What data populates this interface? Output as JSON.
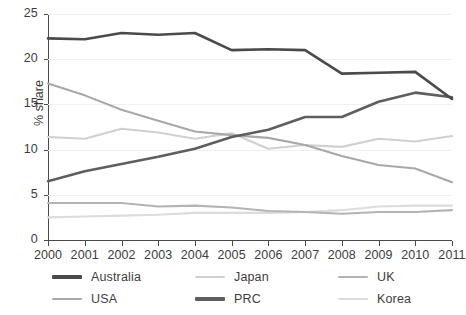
{
  "chart_data": {
    "type": "line",
    "title": "",
    "subtitle": "",
    "xlabel": "",
    "ylabel": "% share",
    "x": [
      2000,
      2001,
      2002,
      2003,
      2004,
      2005,
      2006,
      2007,
      2008,
      2009,
      2010,
      2011
    ],
    "xticklabels": [
      "2000",
      "2001",
      "2002",
      "2003",
      "2004",
      "2005",
      "2006",
      "2007",
      "2008",
      "2009",
      "2010",
      "2011"
    ],
    "yticklabels": [
      "0",
      "5",
      "10",
      "15",
      "20",
      "25"
    ],
    "yticks": [
      0,
      5,
      10,
      15,
      20,
      25
    ],
    "ylim": [
      0,
      25
    ],
    "xlim": [
      2000,
      2011
    ],
    "grid": true,
    "grid_axis": "y",
    "legend_position": "bottom",
    "legend_columns": 3,
    "series": [
      {
        "name": "Australia",
        "color": "#4a4a4a",
        "width": 2.6,
        "values": [
          22.3,
          22.2,
          22.9,
          22.7,
          22.9,
          21.0,
          21.1,
          21.0,
          18.4,
          18.5,
          18.6,
          15.6
        ]
      },
      {
        "name": "USA",
        "color": "#a8a8a8",
        "width": 2.1,
        "values": [
          17.3,
          16.0,
          14.4,
          13.2,
          12.0,
          11.6,
          11.3,
          10.5,
          9.3,
          8.3,
          7.9,
          6.4
        ]
      },
      {
        "name": "Japan",
        "color": "#d0d0d0",
        "width": 2.1,
        "values": [
          11.4,
          11.2,
          12.3,
          11.9,
          11.2,
          11.8,
          10.1,
          10.5,
          10.3,
          11.2,
          10.9,
          11.5
        ]
      },
      {
        "name": "PRC",
        "color": "#5e5e5e",
        "width": 2.6,
        "values": [
          6.5,
          7.6,
          8.4,
          9.2,
          10.1,
          11.4,
          12.2,
          13.6,
          13.6,
          15.3,
          16.3,
          15.8
        ]
      },
      {
        "name": "UK",
        "color": "#b4b4b4",
        "width": 2.1,
        "values": [
          4.1,
          4.1,
          4.1,
          3.7,
          3.8,
          3.6,
          3.2,
          3.1,
          2.9,
          3.1,
          3.1,
          3.3
        ]
      },
      {
        "name": "Korea",
        "color": "#dcdcdc",
        "width": 2.1,
        "values": [
          2.5,
          2.6,
          2.7,
          2.8,
          3.0,
          3.0,
          3.0,
          3.1,
          3.3,
          3.7,
          3.8,
          3.8
        ]
      }
    ]
  },
  "axes": {
    "ylabel": "% share"
  },
  "legend": {
    "items": [
      {
        "label": "Australia",
        "color": "#4a4a4a",
        "width": 3.4
      },
      {
        "label": "USA",
        "color": "#a8a8a8",
        "width": 2.6
      },
      {
        "label": "Japan",
        "color": "#d0d0d0",
        "width": 2.6
      },
      {
        "label": "PRC",
        "color": "#5e5e5e",
        "width": 3.4
      },
      {
        "label": "UK",
        "color": "#b4b4b4",
        "width": 2.6
      },
      {
        "label": "Korea",
        "color": "#dcdcdc",
        "width": 2.6
      }
    ]
  }
}
